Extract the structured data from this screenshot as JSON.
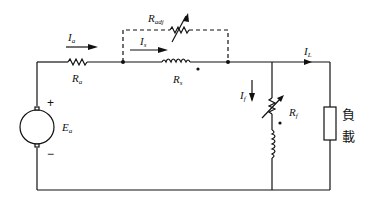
{
  "diagram": {
    "type": "circuit",
    "title": "",
    "labels": {
      "armature_current": {
        "base": "I",
        "sub": "a"
      },
      "armature_resistance": {
        "base": "R",
        "sub": "a"
      },
      "series_current": {
        "base": "I",
        "sub": "s"
      },
      "diverter_resistance": {
        "base": "R",
        "sub": "adj"
      },
      "series_field_resistance": {
        "base": "R",
        "sub": "s"
      },
      "load_current": {
        "base": "I",
        "sub": "L"
      },
      "shunt_current": {
        "base": "I",
        "sub": "f"
      },
      "shunt_field_resistance": {
        "base": "R",
        "sub": "f"
      },
      "generated_emf": {
        "base": "E",
        "sub": "a"
      },
      "plus_sign": "+",
      "minus_sign": "−",
      "load_line1": "負",
      "load_line2": "載"
    },
    "components": [
      {
        "id": "generator",
        "kind": "dc-machine-armature",
        "label": "E_a"
      },
      {
        "id": "Ra",
        "kind": "resistor",
        "label": "R_a"
      },
      {
        "id": "Rs",
        "kind": "series-field-coil",
        "label": "R_s"
      },
      {
        "id": "Radj",
        "kind": "variable-resistor",
        "label": "R_adj",
        "style": "dashed-parallel-diverter"
      },
      {
        "id": "Rf",
        "kind": "variable-resistor",
        "label": "R_f"
      },
      {
        "id": "shunt_coil",
        "kind": "shunt-field-coil"
      },
      {
        "id": "load",
        "kind": "load-box",
        "label": "負載"
      }
    ],
    "currents": [
      {
        "name": "I_a",
        "direction": "right"
      },
      {
        "name": "I_s",
        "direction": "right"
      },
      {
        "name": "I_L",
        "direction": "right"
      },
      {
        "name": "I_f",
        "direction": "down"
      }
    ],
    "colors": {
      "line": "#111111",
      "background": "#ffffff"
    }
  }
}
